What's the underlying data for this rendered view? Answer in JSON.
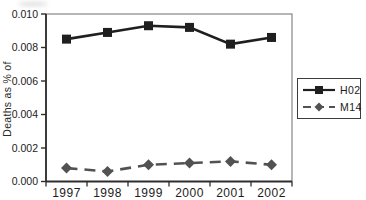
{
  "chart": {
    "bg_color": "#ffffff",
    "axis_color": "#2e2e2e",
    "plot_box_color": "#6e6e6e",
    "text_color": "#1c1c1c",
    "legend_border_color": "#3c3c3c"
  },
  "chart_data": {
    "type": "line",
    "title": "",
    "xlabel": "",
    "ylabel": "Deaths as % of",
    "categories": [
      "1997",
      "1998",
      "1999",
      "2000",
      "2001",
      "2002"
    ],
    "series": [
      {
        "name": "H02",
        "color": "#1f1f1f",
        "marker": "square",
        "line_style": "solid",
        "values": [
          0.0085,
          0.0089,
          0.0093,
          0.0092,
          0.0082,
          0.0086
        ]
      },
      {
        "name": "M14",
        "color": "#525252",
        "marker": "diamond",
        "line_style": "dashed",
        "values": [
          0.0008,
          0.0006,
          0.001,
          0.0011,
          0.0012,
          0.001
        ]
      }
    ],
    "ylim": [
      0,
      0.01
    ],
    "y_ticks": [
      "0.000",
      "0.002",
      "0.004",
      "0.006",
      "0.008",
      "0.010"
    ],
    "grid": false,
    "legend_position": "right-outside"
  }
}
